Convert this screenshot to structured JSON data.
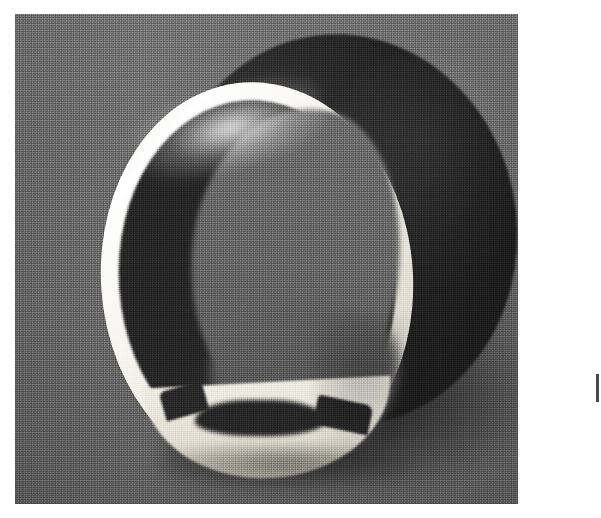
{
  "page": {
    "kind": "scanned-photograph",
    "paper_color": "#ffffff",
    "width_px": 601,
    "height_px": 518
  },
  "photo": {
    "caption": "",
    "subject": "white ring-shaped cylindrical band standing upright, viewed at an oblique angle",
    "technique": "halftone black-and-white print reproduction",
    "frame": {
      "left_px": 15,
      "top_px": 14,
      "width_px": 503,
      "height_px": 490
    },
    "backdrop_color": "#6d6d6d",
    "regions": [
      {
        "name": "studio-backdrop",
        "description": "flat gray seamless backdrop with soft top-lighting falling off toward the lower edge",
        "color": "#6d6d6d"
      },
      {
        "name": "cylinder-outer-wall",
        "description": "dark shadowed outer barrel of the ring receding back and to the right",
        "color": "#272727"
      },
      {
        "name": "cylinder-inner-wall",
        "description": "dark shadowed inner surface of the band seen through the opening",
        "color": "#232323"
      },
      {
        "name": "ring-opening-see-through",
        "description": "mid-gray backdrop visible straight through the hole of the ring",
        "color": "#686868"
      },
      {
        "name": "front-rim",
        "description": "bright white front rim of the band, brightest at the upper left where the key light hits",
        "color": "#f7f5ef"
      },
      {
        "name": "rim-bottom-step",
        "description": "thicker stepped white section along the bottom of the band with two notch steps",
        "color": "#e6e2d7"
      },
      {
        "name": "cast-shadow",
        "description": "soft cast shadow spreading right and down onto the table surface",
        "color": "#3f3f3f"
      },
      {
        "name": "contact-shadow",
        "description": "dark contact shadow where the ring meets the surface",
        "color": "#343434"
      }
    ],
    "artifacts": [
      {
        "name": "scan-mark",
        "description": "thin dark scanning artifact in the right-hand white margin",
        "color": "#4a4a4a"
      }
    ]
  }
}
